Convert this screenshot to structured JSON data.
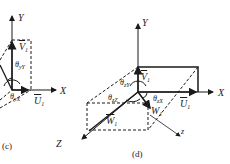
{
  "figure": {
    "panels": [
      {
        "id": "c",
        "caption": "(c)",
        "axes": {
          "x": "X",
          "y": "Y",
          "z": "Z"
        },
        "vectors": {
          "v": "V",
          "u": "U",
          "subscript": "1"
        },
        "angles": [
          {
            "name": "θyY",
            "base": "θ",
            "sub": "yY"
          },
          {
            "name": "θyX",
            "base": "θ",
            "sub": "yX"
          }
        ]
      },
      {
        "id": "d",
        "caption": "(d)",
        "axes": {
          "x": "X",
          "y": "Y",
          "z_small": "z"
        },
        "vectors": {
          "v": "V",
          "u": "U",
          "w": "W",
          "w_plain": "W",
          "subscript": "1"
        },
        "angles": [
          {
            "name": "θzY",
            "base": "θ",
            "sub": "zY"
          },
          {
            "name": "θzZ",
            "base": "θ",
            "sub": "zZ"
          },
          {
            "name": "θzX",
            "base": "θ",
            "sub": "zX"
          }
        ]
      }
    ],
    "colors": {
      "ink": "#1a1a1a",
      "background": "#ffffff"
    }
  }
}
